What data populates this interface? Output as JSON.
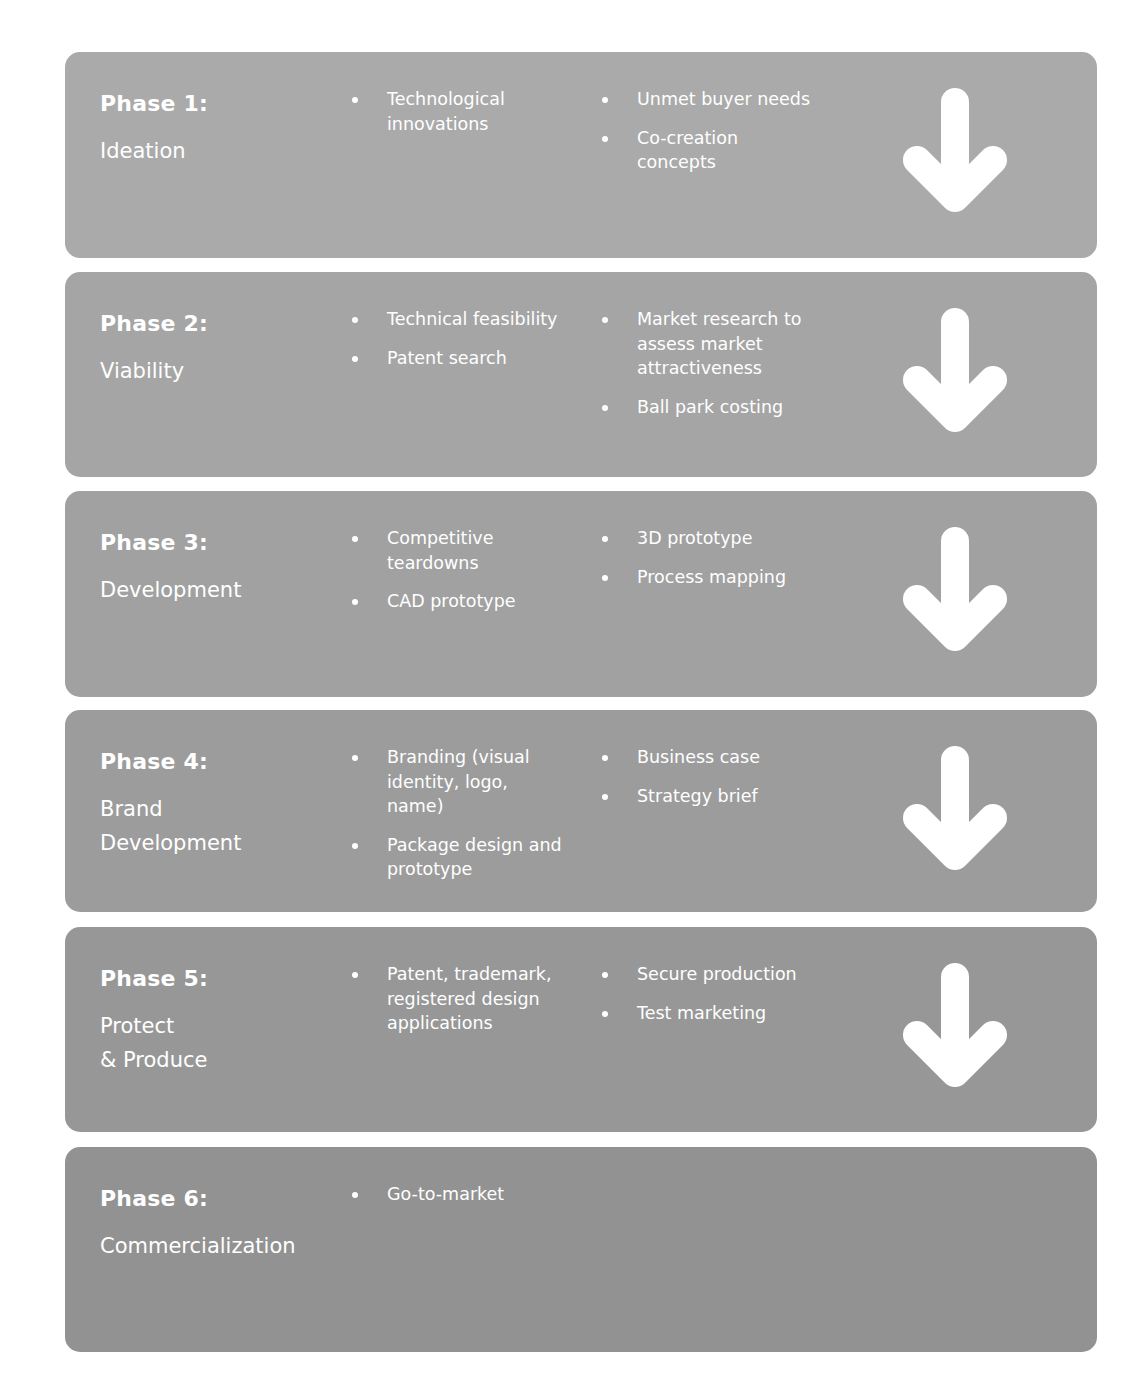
{
  "colors": {
    "text": "#ffffff",
    "arrow": "#ffffff",
    "phase_backgrounds": [
      "#aaaaaa",
      "#a5a5a5",
      "#a1a1a1",
      "#9c9c9c",
      "#979797",
      "#929292"
    ]
  },
  "phases": [
    {
      "title": "Phase 1:",
      "subtitle": "Ideation",
      "col1": [
        "Technological innovations"
      ],
      "col2": [
        "Unmet buyer needs",
        "Co-creation concepts"
      ],
      "has_arrow": true,
      "arrow_icon": "arrow-down-icon"
    },
    {
      "title": "Phase 2:",
      "subtitle": "Viability",
      "col1": [
        "Technical feasibility",
        "Patent search"
      ],
      "col2": [
        "Market research to assess market attractiveness",
        "Ball park costing"
      ],
      "has_arrow": true,
      "arrow_icon": "arrow-down-icon"
    },
    {
      "title": "Phase 3:",
      "subtitle": "Development",
      "col1": [
        "Competitive teardowns",
        "CAD prototype"
      ],
      "col2": [
        "3D prototype",
        "Process mapping"
      ],
      "has_arrow": true,
      "arrow_icon": "arrow-down-icon"
    },
    {
      "title": "Phase 4:",
      "subtitle": "Brand\nDevelopment",
      "col1": [
        "Branding (visual identity, logo, name)",
        "Package design and prototype"
      ],
      "col2": [
        "Business case",
        "Strategy brief"
      ],
      "has_arrow": true,
      "arrow_icon": "arrow-down-icon"
    },
    {
      "title": "Phase 5:",
      "subtitle": "Protect\n& Produce",
      "col1": [
        "Patent, trademark, registered design applications"
      ],
      "col2": [
        "Secure production",
        "Test marketing"
      ],
      "has_arrow": true,
      "arrow_icon": "arrow-down-icon"
    },
    {
      "title": "Phase 6:",
      "subtitle": "Commercialization",
      "col1": [
        "Go-to-market"
      ],
      "col2": [],
      "has_arrow": false
    }
  ]
}
